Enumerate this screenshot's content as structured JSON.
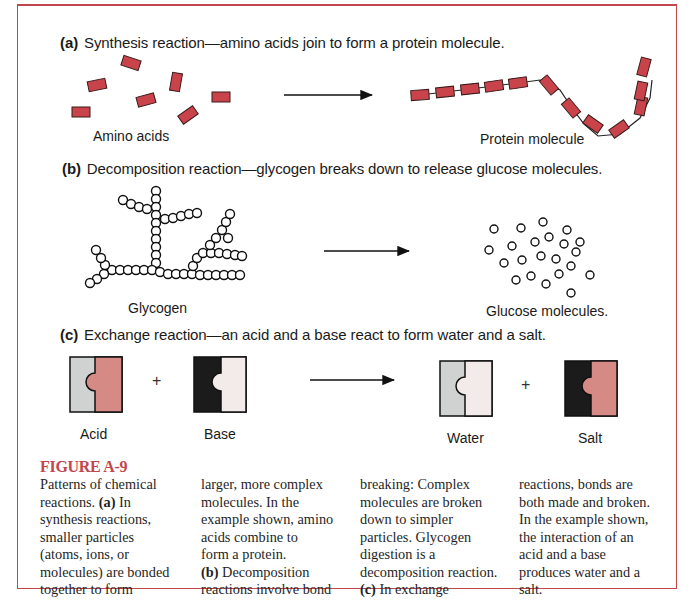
{
  "panels": {
    "a": {
      "letter": "(a)",
      "heading": "Synthesis reaction—amino acids join to form a protein molecule.",
      "left_label": "Amino acids",
      "right_label": "Protein molecule"
    },
    "b": {
      "letter": "(b)",
      "heading": "Decomposition reaction—glycogen breaks down to release glucose molecules.",
      "left_label": "Glycogen",
      "right_label": "Glucose molecules."
    },
    "c": {
      "letter": "(c)",
      "heading": "Exchange reaction—an acid and a base react to form water and a salt.",
      "labels": [
        "Acid",
        "Base",
        "Water",
        "Salt"
      ],
      "plus": "+"
    }
  },
  "caption": {
    "title": "FIGURE A-9",
    "columns": [
      "Patterns of chemical\nreactions. |(a)| In\nsynthesis reactions,\nsmaller particles\n(atoms, ions, or\nmolecules) are bonded\ntogether to form",
      "larger, more complex\nmolecules. In the\nexample shown, amino\nacids combine to\nform a protein.\n|(b)| Decomposition\nreactions involve bond",
      "breaking: Complex\nmolecules are broken\ndown to simpler\nparticles. Glycogen\ndigestion is a\ndecomposition reaction.\n|(c)| In exchange",
      "reactions, bonds are\nboth made and broken.\nIn the example shown,\nthe interaction of an\nacid and a base\nproduces water and a\nsalt."
    ]
  },
  "colors": {
    "frame": "#c2464b",
    "amino_red": "#c9444a",
    "gray": "#cfd2d1",
    "pink": "#d58a86",
    "light": "#f3ebe9",
    "black": "#1b1b1b"
  }
}
